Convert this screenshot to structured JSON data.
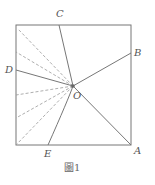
{
  "diagram": {
    "caption": "圖1",
    "square": {
      "x": 16,
      "y": 25,
      "w": 115,
      "h": 120
    },
    "center": {
      "label": "O",
      "x": 73,
      "y": 86
    },
    "points": [
      {
        "label": "A",
        "x": 131,
        "y": 145
      },
      {
        "label": "B",
        "x": 131,
        "y": 53
      },
      {
        "label": "C",
        "x": 59,
        "y": 25
      },
      {
        "label": "D",
        "x": 16,
        "y": 70
      },
      {
        "label": "E",
        "x": 48,
        "y": 145
      }
    ],
    "dashed_endpoints": [
      {
        "x": 18,
        "y": 29
      },
      {
        "x": 16,
        "y": 52
      },
      {
        "x": 16,
        "y": 95
      },
      {
        "x": 16,
        "y": 118
      },
      {
        "x": 16,
        "y": 145
      }
    ],
    "colors": {
      "stroke": "#777777",
      "dash": "#999999",
      "label": "#555555"
    }
  }
}
